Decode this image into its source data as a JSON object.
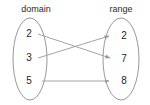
{
  "diagram": {
    "type": "mapping-diagram",
    "background_color": "#ffffff",
    "stroke_color": "#9a9a9a",
    "text_color": "#1e1e1e",
    "sets": {
      "domain": {
        "label": "domain",
        "label_x": 36,
        "label_y": 12,
        "ellipse": {
          "cx": 30,
          "cy": 59,
          "rx": 17,
          "ry": 41
        },
        "elements": [
          {
            "value": "2",
            "x": 29,
            "y": 34
          },
          {
            "value": "3",
            "x": 29,
            "y": 58
          },
          {
            "value": "5",
            "x": 29,
            "y": 81
          }
        ]
      },
      "range": {
        "label": "range",
        "label_x": 121,
        "label_y": 12,
        "ellipse": {
          "cx": 121,
          "cy": 59,
          "rx": 18,
          "ry": 41
        },
        "elements": [
          {
            "value": "2",
            "x": 124,
            "y": 36
          },
          {
            "value": "7",
            "x": 124,
            "y": 59
          },
          {
            "value": "8",
            "x": 124,
            "y": 81
          }
        ]
      }
    },
    "mappings": [
      {
        "from": "2",
        "to": "7",
        "x1": 38,
        "y1": 34,
        "x2": 112,
        "y2": 59
      },
      {
        "from": "3",
        "to": "2",
        "x1": 38,
        "y1": 58,
        "x2": 111,
        "y2": 36
      },
      {
        "from": "5",
        "to": "8",
        "x1": 42,
        "y1": 81,
        "x2": 111,
        "y2": 81
      }
    ]
  }
}
